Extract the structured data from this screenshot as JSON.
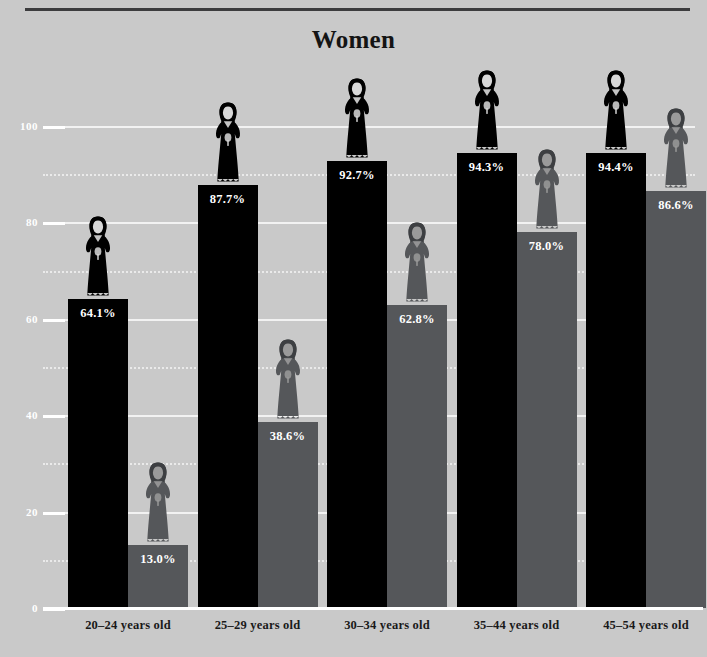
{
  "header": {
    "title": "Women"
  },
  "colors": {
    "background": "#c9c9c9",
    "primary_series": "#000000",
    "secondary_series": "#55575a",
    "gridline": "#f2f2f2",
    "axis": "#ffffff",
    "rule": "#3c3c3e",
    "label_text": "#ffffff",
    "tick_text": "#191919"
  },
  "chart_data": {
    "type": "bar",
    "title": "Women",
    "xlabel": "",
    "ylabel": "",
    "ylim": [
      0,
      100
    ],
    "yticks": [
      0,
      20,
      40,
      60,
      80,
      100
    ],
    "ytick_labels": [
      "0",
      "20",
      "40",
      "60",
      "80",
      "100"
    ],
    "minor_yticks": [
      10,
      30,
      50,
      70,
      90
    ],
    "grid": true,
    "legend": null,
    "categories": [
      "20–24 years old",
      "25–29 years old",
      "30–34 years old",
      "35–44 years old",
      "45–54 years old"
    ],
    "series": [
      {
        "name": "primary",
        "color": "#000000",
        "values": [
          64.1,
          87.7,
          92.7,
          94.3,
          94.4
        ],
        "labels": [
          "64.1%",
          "87.7%",
          "92.7%",
          "94.3%",
          "94.4%"
        ]
      },
      {
        "name": "secondary",
        "color": "#55575a",
        "values": [
          13.0,
          38.6,
          62.8,
          78.0,
          86.6
        ],
        "labels": [
          "13.0%",
          "38.6%",
          "62.8%",
          "78.0%",
          "86.6%"
        ]
      }
    ],
    "icon": "woman-figure-icon"
  }
}
